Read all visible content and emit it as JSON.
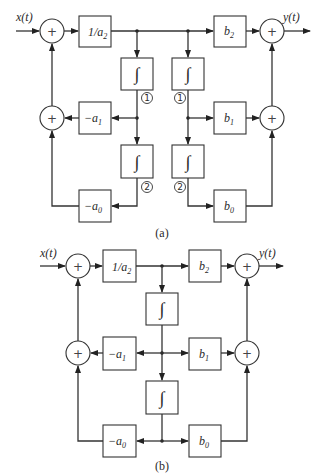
{
  "figure": {
    "diagram_a": {
      "caption": "(a)",
      "input_label": "x(t)",
      "output_label": "y(t)",
      "gain_input": {
        "main": "1/a",
        "sub": "2"
      },
      "feedback": [
        {
          "main": "−a",
          "sub": "1"
        },
        {
          "main": "−a",
          "sub": "0"
        }
      ],
      "feedforward": [
        {
          "main": "b",
          "sub": "2"
        },
        {
          "main": "b",
          "sub": "1"
        },
        {
          "main": "b",
          "sub": "0"
        }
      ],
      "integrator_symbol": "∫",
      "node_labels": [
        "1",
        "2",
        "1",
        "2"
      ],
      "adder_symbol": "+"
    },
    "diagram_b": {
      "caption": "(b)",
      "input_label": "x(t)",
      "output_label": "y(t)",
      "gain_input": {
        "main": "1/a",
        "sub": "2"
      },
      "feedback": [
        {
          "main": "−a",
          "sub": "1"
        },
        {
          "main": "−a",
          "sub": "0"
        }
      ],
      "feedforward": [
        {
          "main": "b",
          "sub": "2"
        },
        {
          "main": "b",
          "sub": "1"
        },
        {
          "main": "b",
          "sub": "0"
        }
      ],
      "integrator_symbol": "∫",
      "adder_symbol": "+"
    }
  }
}
